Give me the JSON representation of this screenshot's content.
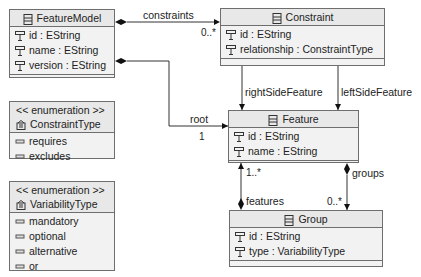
{
  "classes": {
    "feature_model": {
      "name": "FeatureModel",
      "attributes": [
        "id : EString",
        "name : EString",
        "version : EString"
      ]
    },
    "constraint": {
      "name": "Constraint",
      "attributes": [
        "id : EString",
        "relationship : ConstraintType"
      ]
    },
    "feature": {
      "name": "Feature",
      "attributes": [
        "id : EString",
        "name : EString"
      ]
    },
    "group": {
      "name": "Group",
      "attributes": [
        "id : EString",
        "type : VariabilityType"
      ]
    }
  },
  "enums": {
    "constraint_type": {
      "stereotype": "<< enumeration >>",
      "name": "ConstraintType",
      "literals": [
        "requires",
        "excludes"
      ]
    },
    "variability_type": {
      "stereotype": "<< enumeration >>",
      "name": "VariabilityType",
      "literals": [
        "mandatory",
        "optional",
        "alternative",
        "or"
      ]
    }
  },
  "associations": {
    "constraints": {
      "label": "constraints",
      "target_mult": "0..*"
    },
    "root": {
      "label": "root",
      "target_mult": "1"
    },
    "right_side_feature": {
      "label": "rightSideFeature",
      "target_mult": "1"
    },
    "left_side_feature": {
      "label": "leftSideFeature",
      "target_mult": "1"
    },
    "features": {
      "label": "features",
      "target_mult": "1..*"
    },
    "groups": {
      "label": "groups",
      "target_mult": "0..*"
    }
  },
  "colors": {
    "box_fill": "#f2f2f2",
    "header_fill": "#e8e8e8",
    "border": "#6e6e6e",
    "line": "#333333"
  }
}
